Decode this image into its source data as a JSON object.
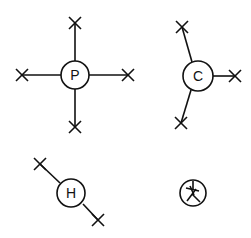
{
  "diagram": {
    "type": "lewis-valence-diagram",
    "atoms": [
      {
        "label": "P",
        "bonds": 4
      },
      {
        "label": "C",
        "bonds": 3
      },
      {
        "label": "H",
        "bonds": 2
      },
      {
        "label": "",
        "bonds": 0,
        "inner_glyph": "star-cross"
      }
    ],
    "color": "#111111"
  }
}
